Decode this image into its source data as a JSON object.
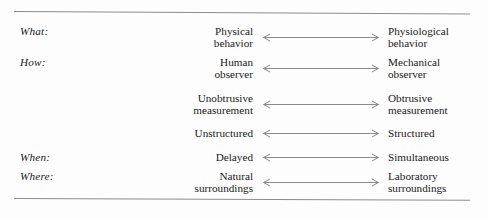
{
  "figure": {
    "rules": {
      "top": "horizontal-rule",
      "bottom": "horizontal-rule"
    },
    "rows": [
      {
        "keyword": "What:",
        "left_pole": "Physical\nbehavior",
        "left_pole_line1": "Physical",
        "left_pole_line2": "behavior",
        "right_pole": "Physiological\nbehavior",
        "right_pole_line1": "Physiological",
        "right_pole_line2": "behavior",
        "arrow": "double-headed-arrow"
      },
      {
        "keyword": "How:",
        "left_pole": "Human\nobserver",
        "left_pole_line1": "Human",
        "left_pole_line2": "observer",
        "right_pole": "Mechanical\nobserver",
        "right_pole_line1": "Mechanical",
        "right_pole_line2": "observer",
        "arrow": "double-headed-arrow"
      },
      {
        "keyword": "",
        "left_pole": "Unobtrusive\nmeasurement",
        "left_pole_line1": "Unobtrusive",
        "left_pole_line2": "measurement",
        "right_pole": "Obtrusive\nmeasurement",
        "right_pole_line1": "Obtrusive",
        "right_pole_line2": "measurement",
        "arrow": "double-headed-arrow"
      },
      {
        "keyword": "",
        "left_pole": "Unstructured",
        "left_pole_line1": "Unstructured",
        "left_pole_line2": "",
        "right_pole": "Structured",
        "right_pole_line1": "Structured",
        "right_pole_line2": "",
        "arrow": "double-headed-arrow"
      },
      {
        "keyword": "When:",
        "left_pole": "Delayed",
        "left_pole_line1": "Delayed",
        "left_pole_line2": "",
        "right_pole": "Simultaneous",
        "right_pole_line1": "Simultaneous",
        "right_pole_line2": "",
        "arrow": "double-headed-arrow"
      },
      {
        "keyword": "Where:",
        "left_pole": "Natural\nsurroundings",
        "left_pole_line1": "Natural",
        "left_pole_line2": "surroundings",
        "right_pole": "Laboratory\nsurroundings",
        "right_pole_line1": "Laboratory",
        "right_pole_line2": "surroundings",
        "arrow": "double-headed-arrow"
      }
    ],
    "colors": {
      "background": "#fdfdfd",
      "text": "#1a1a1a",
      "rule": "#8c8c8c",
      "arrow": "#8a8a8a"
    }
  }
}
